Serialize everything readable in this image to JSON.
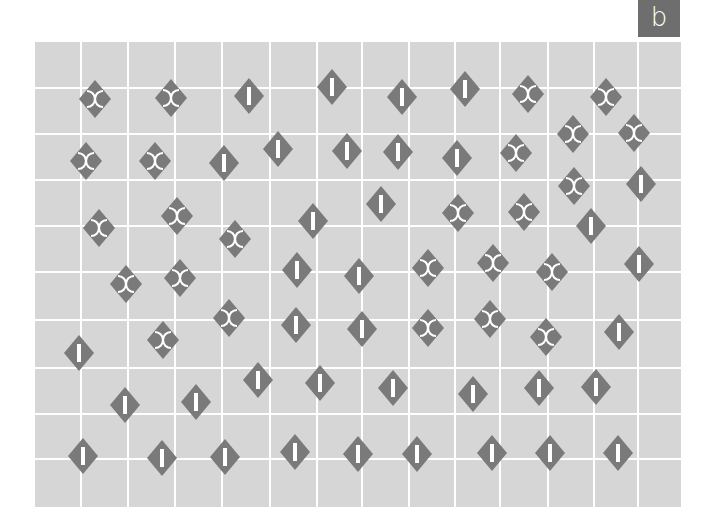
{
  "panel": {
    "label": "b",
    "label_bg": "#6e6e6e",
    "grid_bg": "#d6d6d6",
    "grid_line_color": "#ffffff",
    "glyph_color": "#7a7a7a"
  },
  "grid": {
    "left": 35,
    "top": 42,
    "right": 681,
    "bottom": 507,
    "vertical_lines": [
      81,
      128,
      175,
      222,
      270,
      317,
      362,
      409,
      455,
      500,
      548,
      594,
      638
    ],
    "horizontal_lines": [
      88,
      134,
      180,
      226,
      272,
      320,
      368,
      414,
      459
    ]
  },
  "glyph_types": {
    "I": "diamond-with-vertical-bar",
    "S": "diamond-with-split-arcs"
  },
  "glyphs": [
    {
      "type": "S",
      "x": 95,
      "y": 99
    },
    {
      "type": "S",
      "x": 171,
      "y": 98
    },
    {
      "type": "I",
      "x": 249,
      "y": 96
    },
    {
      "type": "I",
      "x": 332,
      "y": 87
    },
    {
      "type": "I",
      "x": 402,
      "y": 97
    },
    {
      "type": "I",
      "x": 465,
      "y": 89
    },
    {
      "type": "S",
      "x": 528,
      "y": 94
    },
    {
      "type": "S",
      "x": 606,
      "y": 97
    },
    {
      "type": "S",
      "x": 573,
      "y": 134
    },
    {
      "type": "S",
      "x": 634,
      "y": 133
    },
    {
      "type": "S",
      "x": 86,
      "y": 161
    },
    {
      "type": "S",
      "x": 155,
      "y": 161
    },
    {
      "type": "I",
      "x": 224,
      "y": 163
    },
    {
      "type": "I",
      "x": 278,
      "y": 149
    },
    {
      "type": "I",
      "x": 347,
      "y": 151
    },
    {
      "type": "I",
      "x": 398,
      "y": 152
    },
    {
      "type": "I",
      "x": 457,
      "y": 158
    },
    {
      "type": "S",
      "x": 516,
      "y": 153
    },
    {
      "type": "S",
      "x": 574,
      "y": 186
    },
    {
      "type": "I",
      "x": 641,
      "y": 184
    },
    {
      "type": "S",
      "x": 99,
      "y": 228
    },
    {
      "type": "S",
      "x": 177,
      "y": 216
    },
    {
      "type": "S",
      "x": 235,
      "y": 239
    },
    {
      "type": "I",
      "x": 313,
      "y": 221
    },
    {
      "type": "I",
      "x": 381,
      "y": 204
    },
    {
      "type": "S",
      "x": 458,
      "y": 213
    },
    {
      "type": "S",
      "x": 524,
      "y": 212
    },
    {
      "type": "I",
      "x": 591,
      "y": 226
    },
    {
      "type": "S",
      "x": 126,
      "y": 284
    },
    {
      "type": "S",
      "x": 180,
      "y": 278
    },
    {
      "type": "I",
      "x": 297,
      "y": 270
    },
    {
      "type": "I",
      "x": 359,
      "y": 276
    },
    {
      "type": "S",
      "x": 428,
      "y": 268
    },
    {
      "type": "S",
      "x": 493,
      "y": 263
    },
    {
      "type": "S",
      "x": 552,
      "y": 272
    },
    {
      "type": "I",
      "x": 639,
      "y": 264
    },
    {
      "type": "I",
      "x": 79,
      "y": 353
    },
    {
      "type": "S",
      "x": 163,
      "y": 340
    },
    {
      "type": "S",
      "x": 229,
      "y": 318
    },
    {
      "type": "I",
      "x": 296,
      "y": 325
    },
    {
      "type": "I",
      "x": 362,
      "y": 329
    },
    {
      "type": "S",
      "x": 428,
      "y": 328
    },
    {
      "type": "S",
      "x": 490,
      "y": 319
    },
    {
      "type": "S",
      "x": 546,
      "y": 337
    },
    {
      "type": "I",
      "x": 619,
      "y": 332
    },
    {
      "type": "I",
      "x": 125,
      "y": 405
    },
    {
      "type": "I",
      "x": 196,
      "y": 402
    },
    {
      "type": "I",
      "x": 258,
      "y": 380
    },
    {
      "type": "I",
      "x": 320,
      "y": 383
    },
    {
      "type": "I",
      "x": 393,
      "y": 388
    },
    {
      "type": "I",
      "x": 473,
      "y": 394
    },
    {
      "type": "I",
      "x": 539,
      "y": 388
    },
    {
      "type": "I",
      "x": 596,
      "y": 387
    },
    {
      "type": "I",
      "x": 83,
      "y": 456
    },
    {
      "type": "I",
      "x": 162,
      "y": 458
    },
    {
      "type": "I",
      "x": 225,
      "y": 457
    },
    {
      "type": "I",
      "x": 295,
      "y": 452
    },
    {
      "type": "I",
      "x": 358,
      "y": 454
    },
    {
      "type": "I",
      "x": 417,
      "y": 454
    },
    {
      "type": "I",
      "x": 492,
      "y": 453
    },
    {
      "type": "I",
      "x": 550,
      "y": 453
    },
    {
      "type": "I",
      "x": 618,
      "y": 453
    }
  ]
}
